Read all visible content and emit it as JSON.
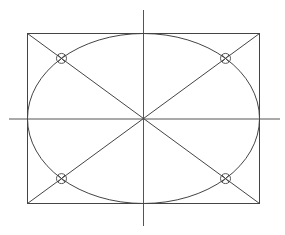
{
  "diagram": {
    "title": "",
    "elements": {
      "axes": [
        "horizontal-centerline",
        "vertical-centerline"
      ],
      "rectangle": "bounding-rectangle",
      "ellipse": "inscribed-ellipse",
      "diagonals": [
        "diagonal-top-left-to-bottom-right",
        "diagonal-top-right-to-bottom-left"
      ],
      "markers": [
        {
          "name": "marker-top-left",
          "symbol": "circle-x"
        },
        {
          "name": "marker-top-right",
          "symbol": "circle-x"
        },
        {
          "name": "marker-bottom-left",
          "symbol": "circle-x"
        },
        {
          "name": "marker-bottom-right",
          "symbol": "circle-x"
        }
      ]
    },
    "colors": {
      "line": "#444444",
      "background": "#ffffff"
    }
  }
}
